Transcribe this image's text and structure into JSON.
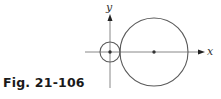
{
  "figure": {
    "caption": "Fig. 21-106",
    "axes": {
      "x_label": "x",
      "y_label": "y"
    },
    "small_circle": {
      "cx": 110,
      "cy": 52,
      "r": 10
    },
    "large_circle": {
      "cx": 154,
      "cy": 52,
      "r": 34
    },
    "line_color": "#6a6a6a",
    "dot_color": "#333333"
  }
}
